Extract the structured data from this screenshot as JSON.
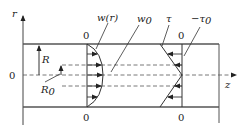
{
  "diagram": {
    "type": "pipe-flow-profile",
    "axes": {
      "vertical_label": "r",
      "horizontal_label": "z",
      "origin_label": "0"
    },
    "labels": {
      "velocity_profile": "w(r)",
      "max_velocity": "w",
      "max_velocity_sub": "0",
      "shear_stress": "τ",
      "wall_shear": "−τ",
      "wall_shear_sub": "0",
      "radius": "R",
      "radius0": "R",
      "radius0_sub": "0",
      "velocity_top_zero": "0",
      "velocity_bottom_zero": "0",
      "shear_top_zero": "0",
      "shear_bottom_zero": "0"
    },
    "colors": {
      "line": "#333333",
      "wall": "#555555",
      "dash": "#555555"
    }
  }
}
